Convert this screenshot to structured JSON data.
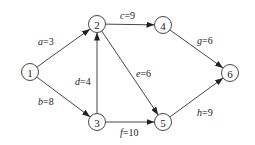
{
  "nodes": [
    {
      "id": "1",
      "x": 30,
      "y": 72
    },
    {
      "id": "2",
      "x": 97,
      "y": 24
    },
    {
      "id": "3",
      "x": 97,
      "y": 122
    },
    {
      "id": "4",
      "x": 163,
      "y": 25
    },
    {
      "id": "5",
      "x": 163,
      "y": 122
    },
    {
      "id": "6",
      "x": 230,
      "y": 73
    }
  ],
  "edges": [
    {
      "from": "1",
      "to": "2",
      "var": "a",
      "weight": "3",
      "lx": 38,
      "ly": 45
    },
    {
      "from": "1",
      "to": "3",
      "var": "b",
      "weight": "8",
      "lx": 38,
      "ly": 105
    },
    {
      "from": "3",
      "to": "2",
      "var": "d",
      "weight": "4",
      "lx": 75,
      "ly": 85
    },
    {
      "from": "2",
      "to": "4",
      "var": "c",
      "weight": "9",
      "lx": 120,
      "ly": 19
    },
    {
      "from": "2",
      "to": "5",
      "var": "e",
      "weight": "6",
      "lx": 136,
      "ly": 77
    },
    {
      "from": "3",
      "to": "5",
      "var": "f",
      "weight": "10",
      "lx": 120,
      "ly": 136
    },
    {
      "from": "4",
      "to": "6",
      "var": "g",
      "weight": "6",
      "lx": 197,
      "ly": 44
    },
    {
      "from": "5",
      "to": "6",
      "var": "h",
      "weight": "9",
      "lx": 197,
      "ly": 116
    }
  ]
}
